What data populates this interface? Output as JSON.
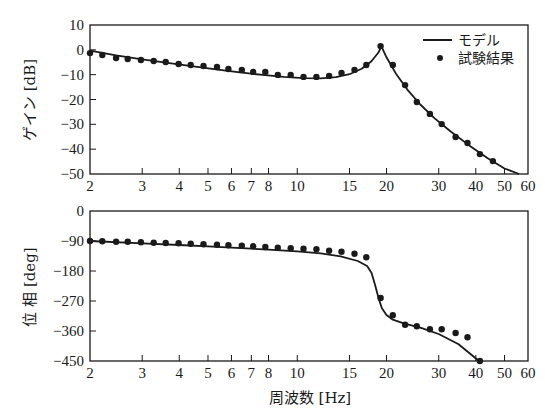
{
  "chart_data": [
    {
      "type": "line",
      "title": "",
      "xlabel": "",
      "ylabel": "ゲイン [dB]",
      "xscale": "log",
      "xlim": [
        2,
        60
      ],
      "ylim": [
        -50,
        10
      ],
      "x_ticks": [
        2,
        3,
        4,
        5,
        6,
        7,
        8,
        10,
        15,
        20,
        30,
        40,
        50,
        60
      ],
      "y_ticks": [
        10,
        0,
        -10,
        -20,
        -30,
        -40,
        -50
      ],
      "grid": false,
      "legend_position": "upper right",
      "legend": [
        {
          "label": "モデル",
          "style": "line"
        },
        {
          "label": "試験結果",
          "style": "marker"
        }
      ],
      "series": [
        {
          "name": "モデル",
          "style": "line",
          "x": [
            2.0,
            2.45,
            3.0,
            3.6,
            4.4,
            5.4,
            6.5,
            7.8,
            9.0,
            10.5,
            12.0,
            13.5,
            15.0,
            16.5,
            17.8,
            18.8,
            19.2,
            20.0,
            21.5,
            23.5,
            26.0,
            29.0,
            33.0,
            38.0,
            44.0,
            50.0,
            56.0
          ],
          "y": [
            -0.3,
            -2.2,
            -3.8,
            -5.2,
            -6.6,
            -8.0,
            -9.2,
            -10.2,
            -10.9,
            -11.4,
            -11.5,
            -11.0,
            -9.8,
            -7.6,
            -4.6,
            -1.0,
            1.5,
            -3.0,
            -9.5,
            -16.0,
            -22.0,
            -27.5,
            -33.0,
            -38.5,
            -43.8,
            -47.8,
            -50.0
          ]
        },
        {
          "name": "試験結果",
          "style": "marker",
          "x": [
            2.0,
            2.2,
            2.45,
            2.68,
            2.97,
            3.28,
            3.6,
            3.98,
            4.37,
            4.83,
            5.36,
            5.86,
            6.5,
            7.1,
            7.8,
            8.6,
            9.5,
            10.5,
            11.6,
            12.8,
            14.1,
            15.6,
            17.1,
            19.1,
            21.0,
            23.1,
            25.3,
            28.0,
            30.7,
            34.2,
            37.5,
            41.3,
            45.7
          ],
          "y": [
            -1.3,
            -2.1,
            -3.3,
            -3.7,
            -4.1,
            -4.5,
            -4.9,
            -5.7,
            -6.1,
            -6.5,
            -6.9,
            -7.7,
            -8.1,
            -8.9,
            -8.9,
            -10.1,
            -10.1,
            -10.9,
            -10.9,
            -10.5,
            -9.3,
            -8.1,
            -6.1,
            1.5,
            -6.1,
            -14.2,
            -21.0,
            -25.8,
            -29.9,
            -35.1,
            -37.5,
            -42.0,
            -44.8
          ]
        }
      ]
    },
    {
      "type": "line",
      "title": "",
      "xlabel": "周波数 [Hz]",
      "ylabel": "位 相 [deg]",
      "xscale": "log",
      "xlim": [
        2,
        60
      ],
      "ylim": [
        -450,
        0
      ],
      "x_ticks": [
        2,
        3,
        4,
        5,
        6,
        7,
        8,
        10,
        15,
        20,
        30,
        40,
        50,
        60
      ],
      "y_ticks": [
        0,
        -90,
        -180,
        -270,
        -360,
        -450
      ],
      "grid": false,
      "series": [
        {
          "name": "モデル",
          "style": "line",
          "x": [
            2.0,
            3.0,
            4.0,
            5.0,
            6.0,
            7.0,
            8.0,
            10.0,
            12.0,
            14.0,
            16.0,
            17.2,
            17.8,
            18.3,
            18.8,
            19.3,
            20.0,
            21.0,
            23.0,
            26.0,
            30.0,
            35.0,
            41.0
          ],
          "y": [
            -90,
            -97,
            -102,
            -106,
            -110,
            -113,
            -116,
            -121,
            -127,
            -136,
            -150,
            -165,
            -185,
            -222,
            -262,
            -292,
            -312,
            -326,
            -338,
            -350,
            -369,
            -400,
            -450
          ]
        },
        {
          "name": "試験結果",
          "style": "marker",
          "x": [
            2.0,
            2.2,
            2.45,
            2.68,
            2.97,
            3.28,
            3.6,
            3.98,
            4.37,
            4.83,
            5.36,
            5.86,
            6.5,
            7.1,
            7.8,
            8.6,
            9.5,
            10.5,
            11.6,
            12.8,
            14.1,
            15.6,
            17.1,
            19.1,
            21.0,
            23.1,
            25.3,
            28.0,
            30.7,
            34.2,
            37.5,
            41.3
          ],
          "y": [
            -90,
            -91,
            -92,
            -92,
            -94,
            -95,
            -96,
            -97,
            -98,
            -100,
            -101,
            -103,
            -104,
            -106,
            -108,
            -110,
            -112,
            -113,
            -115,
            -119,
            -122,
            -128,
            -139,
            -261,
            -313,
            -341,
            -346,
            -355,
            -355,
            -366,
            -379,
            -450
          ]
        }
      ]
    }
  ],
  "labels": {
    "top_ylabel": "ゲイン [dB]",
    "bottom_ylabel": "位 相 [deg]",
    "xlabel": "周波数 [Hz]",
    "legend_model": "モデル",
    "legend_test": "試験結果",
    "x_tick_labels": [
      "2",
      "3",
      "4",
      "5",
      "6",
      "7",
      "8",
      "10",
      "15",
      "20",
      "30",
      "40",
      "50",
      "60"
    ],
    "top_y_tick_labels": [
      "10",
      "0",
      "−10",
      "−20",
      "−30",
      "−40",
      "−50"
    ],
    "bottom_y_tick_labels": [
      "0",
      "−90",
      "−180",
      "−270",
      "−360",
      "−450"
    ]
  }
}
